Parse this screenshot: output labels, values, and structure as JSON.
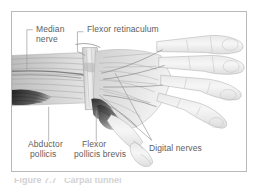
{
  "figure": {
    "kind": "anatomical-illustration",
    "frame": {
      "border_color": "#b9b9b9",
      "background": "#ffffff"
    },
    "ink": {
      "outline": "#9a9a9a",
      "muscle_dark": "#3d3d3d",
      "muscle_mid": "#7f7f7f",
      "tissue_light": "#d8d8d8",
      "nerve_line": "#6b6b6b",
      "leader_line": "#9b9b9b",
      "label_text": "#5e5e5e"
    },
    "labels": [
      {
        "id": "median-nerve",
        "line1": "Median",
        "line2": "nerve"
      },
      {
        "id": "flexor-retinaculum",
        "line1": "Flexor retinaculum",
        "line2": ""
      },
      {
        "id": "abductor-pollicis",
        "line1": "Abductor",
        "line2": "pollicis"
      },
      {
        "id": "flexor-pollicis-brevis",
        "line1": "Flexor",
        "line2": "pollicis brevis"
      },
      {
        "id": "digital-nerves",
        "line1": "Digital nerves",
        "line2": ""
      }
    ],
    "caption": {
      "text": "Figure 7.7   Carpal tunnel"
    }
  }
}
